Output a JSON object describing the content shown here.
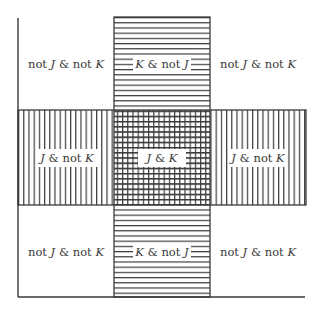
{
  "diagram": {
    "type": "venn-grid",
    "colors": {
      "line": "#3a3a3a",
      "background": "#ffffff",
      "text": "#3a3a3a"
    },
    "regions": {
      "top_left": {
        "pre": "not ",
        "v1": "J",
        "mid": " & not ",
        "v2": "K"
      },
      "top_center": {
        "v1": "K",
        "mid": " & not ",
        "v2": "J"
      },
      "top_right": {
        "pre": "not ",
        "v1": "J",
        "mid": " & not ",
        "v2": "K"
      },
      "middle_left": {
        "v1": "J",
        "mid": " & not ",
        "v2": "K"
      },
      "middle_center": {
        "v1": "J",
        "mid": " & ",
        "v2": "K"
      },
      "middle_right": {
        "v1": "J",
        "mid": " & not ",
        "v2": "K"
      },
      "bottom_left": {
        "pre": "not ",
        "v1": "J",
        "mid": " & not ",
        "v2": "K"
      },
      "bottom_center": {
        "v1": "K",
        "mid": " & not ",
        "v2": "J"
      },
      "bottom_right": {
        "pre": "not ",
        "v1": "J",
        "mid": " & not ",
        "v2": "K"
      }
    },
    "hatching": {
      "K_band": "horizontal-lines",
      "J_band": "vertical-lines",
      "J_and_K": "cross-hatch"
    }
  }
}
